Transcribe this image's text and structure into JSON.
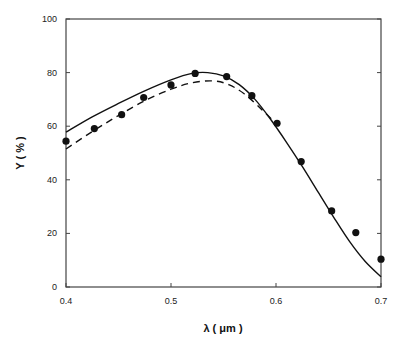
{
  "chart_data": {
    "type": "line",
    "title": "",
    "xlabel": "λ  ( μm )",
    "ylabel": "Y ( % )",
    "xlim": [
      0.4,
      0.7
    ],
    "ylim": [
      0,
      100
    ],
    "xticks": [
      0.4,
      0.5,
      0.6,
      0.7
    ],
    "xtick_labels": [
      "0.4",
      "0.5",
      "0.6",
      "0.7"
    ],
    "yticks": [
      0,
      20,
      40,
      60,
      80,
      100
    ],
    "ytick_labels": [
      "0",
      "20",
      "40",
      "60",
      "80",
      "100"
    ],
    "grid": false,
    "legend": "none",
    "series": [
      {
        "name": "measured",
        "style": "markers",
        "x": [
          0.4,
          0.427,
          0.453,
          0.474,
          0.5,
          0.523,
          0.553,
          0.577,
          0.601,
          0.624,
          0.653,
          0.676,
          0.7
        ],
        "y": [
          54.4,
          59.1,
          64.3,
          70.7,
          75.4,
          79.7,
          78.5,
          71.4,
          61.1,
          46.8,
          28.4,
          20.3,
          10.4
        ]
      },
      {
        "name": "solid-curve",
        "style": "solid",
        "x": [
          0.4,
          0.425,
          0.45,
          0.475,
          0.5,
          0.52,
          0.535,
          0.55,
          0.565,
          0.58,
          0.595,
          0.61,
          0.625,
          0.64,
          0.655,
          0.67,
          0.685,
          0.7
        ],
        "y": [
          57.8,
          63.5,
          68.5,
          73.2,
          77.3,
          79.7,
          80.0,
          78.8,
          75.5,
          70.0,
          62.5,
          54.0,
          45.0,
          35.5,
          26.0,
          17.0,
          9.5,
          3.8
        ]
      },
      {
        "name": "dashed-curve",
        "style": "dashed",
        "x": [
          0.4,
          0.425,
          0.45,
          0.475,
          0.5,
          0.52,
          0.54,
          0.555,
          0.57,
          0.587,
          0.6
        ],
        "y": [
          51.5,
          58.0,
          64.0,
          69.5,
          73.8,
          76.2,
          76.9,
          75.5,
          72.0,
          66.0,
          61.0
        ]
      }
    ]
  }
}
